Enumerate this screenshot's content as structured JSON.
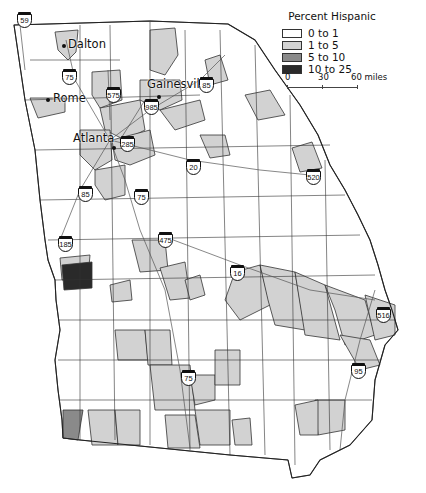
{
  "map": {
    "subject": "Georgia counties by percent Hispanic",
    "cities": [
      {
        "name": "Dalton",
        "x": 67,
        "y": 40,
        "dot_x": 63,
        "dot_y": 45
      },
      {
        "name": "Rome",
        "x": 52,
        "y": 93,
        "dot_x": 46,
        "dot_y": 99
      },
      {
        "name": "Gainesville",
        "x": 148,
        "y": 79,
        "dot_x": 158,
        "dot_y": 95
      },
      {
        "name": "Atlanta",
        "x": 72,
        "y": 131,
        "dot_x": 113,
        "dot_y": 147
      }
    ],
    "highways": [
      {
        "number": "59",
        "x": 16,
        "y": 12
      },
      {
        "number": "75",
        "x": 62,
        "y": 70
      },
      {
        "number": "575",
        "x": 106,
        "y": 88
      },
      {
        "number": "985",
        "x": 143,
        "y": 99
      },
      {
        "number": "85",
        "x": 198,
        "y": 78
      },
      {
        "number": "285",
        "x": 119,
        "y": 136
      },
      {
        "number": "20",
        "x": 185,
        "y": 159
      },
      {
        "number": "520",
        "x": 305,
        "y": 169
      },
      {
        "number": "75",
        "x": 133,
        "y": 190
      },
      {
        "number": "85",
        "x": 77,
        "y": 186
      },
      {
        "number": "185",
        "x": 57,
        "y": 237
      },
      {
        "number": "475",
        "x": 157,
        "y": 233
      },
      {
        "number": "16",
        "x": 229,
        "y": 265
      },
      {
        "number": "516",
        "x": 375,
        "y": 307
      },
      {
        "number": "95",
        "x": 350,
        "y": 363
      },
      {
        "number": "75",
        "x": 180,
        "y": 370
      }
    ]
  },
  "legend": {
    "title": "Percent Hispanic",
    "items": [
      {
        "label": "0 to 1",
        "color": "#ffffff"
      },
      {
        "label": "1 to 5",
        "color": "#d2d2d2"
      },
      {
        "label": "5 to 10",
        "color": "#8a8a8a"
      },
      {
        "label": "10 to 25",
        "color": "#2a2a2a"
      }
    ]
  },
  "scale_bar": {
    "ticks": [
      "0",
      "30",
      "60 miles"
    ]
  }
}
